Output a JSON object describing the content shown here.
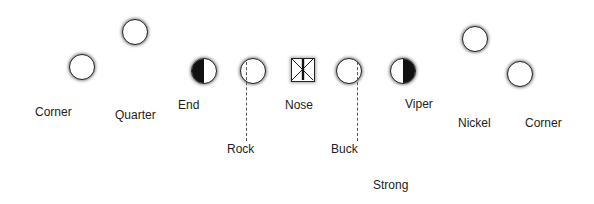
{
  "diagram": {
    "players": [
      {
        "id": "corner-left",
        "label": "Corner",
        "symbol": "circle-open"
      },
      {
        "id": "quarter",
        "label": "Quarter",
        "symbol": "circle-open"
      },
      {
        "id": "end",
        "label": "End",
        "symbol": "circle-half-left-filled"
      },
      {
        "id": "rock",
        "label": "Rock",
        "symbol": "circle-open-dashed-leader"
      },
      {
        "id": "nose",
        "label": "Nose",
        "symbol": "square-x-bar"
      },
      {
        "id": "buck",
        "label": "Buck",
        "symbol": "circle-open-dashed-leader"
      },
      {
        "id": "viper",
        "label": "Viper",
        "symbol": "circle-half-right-filled"
      },
      {
        "id": "nickel",
        "label": "Nickel",
        "symbol": "circle-open"
      },
      {
        "id": "corner-right",
        "label": "Corner",
        "symbol": "circle-open"
      }
    ],
    "extra_labels": {
      "strong": "Strong"
    },
    "colors": {
      "stroke": "#222222",
      "fill": "#111111",
      "background": "#ffffff"
    }
  }
}
